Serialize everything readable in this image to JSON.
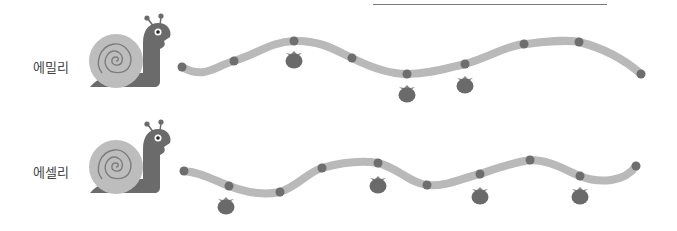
{
  "colors": {
    "path": "#b9b9b9",
    "dot": "#6e6e6e",
    "apple": "#6a6a6a",
    "apple_leaf": "#8a8a8a",
    "shell": "#bdbdbd",
    "shell_spiral": "#7c7c7c",
    "body": "#6b6b6b",
    "eye": "#ffffff",
    "pupil": "#222222",
    "top_line": "#7a7a7a"
  },
  "rows": [
    {
      "name": "에밀리",
      "label_pos": [
        33,
        65
      ],
      "snail_pos": [
        88,
        15
      ],
      "path": "M182,67 C205,80 215,66 234,61 C258,54 270,42 294,41 C320,40 335,50 352,58 C372,68 390,74 407,74 C430,74 448,68 465,64 C488,58 505,46 524,44 C545,42 565,39 579,42 C603,48 625,60 641,74",
      "dots": [
        [
          182,
          67
        ],
        [
          234,
          61
        ],
        [
          294,
          41
        ],
        [
          352,
          58
        ],
        [
          407,
          74
        ],
        [
          465,
          64
        ],
        [
          524,
          44
        ],
        [
          579,
          42
        ],
        [
          641,
          74
        ]
      ],
      "apples": [
        [
          294,
          58
        ],
        [
          407,
          92
        ],
        [
          465,
          83
        ]
      ]
    },
    {
      "name": "에셀리",
      "label_pos": [
        33,
        170
      ],
      "snail_pos": [
        88,
        121
      ],
      "path": "M184,171 C200,172 214,180 229,186 C245,192 262,196 280,192 C298,186 308,172 322,168 C340,163 360,160 378,163 C398,168 410,183 427,185 C446,187 462,178 480,174 C498,168 515,162 530,160 C550,160 565,170 580,176 C600,184 625,182 636,166",
      "dots": [
        [
          184,
          171
        ],
        [
          229,
          186
        ],
        [
          280,
          192
        ],
        [
          322,
          168
        ],
        [
          378,
          163
        ],
        [
          427,
          185
        ],
        [
          480,
          174
        ],
        [
          530,
          160
        ],
        [
          580,
          176
        ],
        [
          636,
          166
        ]
      ],
      "apples": [
        [
          226,
          204
        ],
        [
          378,
          183
        ],
        [
          480,
          194
        ],
        [
          580,
          194
        ]
      ]
    }
  ]
}
